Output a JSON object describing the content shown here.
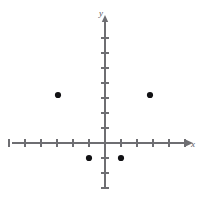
{
  "figure": {
    "background_color": "#ffffff",
    "axis_color": "#6e6e72",
    "point_color": "#111114"
  },
  "axes": {
    "x_label": "x",
    "y_label": "y",
    "origin_px": {
      "x": 105,
      "y": 143
    },
    "unit_px": {
      "x": 16,
      "y": 15
    },
    "x_line_px": {
      "x1": 12,
      "x2": 186,
      "y": 143
    },
    "y_line_px": {
      "y1": 22,
      "y2": 188,
      "x": 105
    },
    "x_ticks": [
      -6,
      -5,
      -4,
      -3,
      -2,
      -1,
      1,
      2,
      3,
      4,
      5
    ],
    "y_ticks": [
      -3,
      -2,
      -1,
      1,
      2,
      3,
      4,
      5,
      6,
      7
    ],
    "tick_half_length_px": 4,
    "arrow_x_px": {
      "x": 186,
      "y": 143
    },
    "arrow_y_px": {
      "x": 105,
      "y": 22
    },
    "x_label_px": {
      "x": 193,
      "y": 147
    },
    "y_label_px": {
      "x": 101,
      "y": 16
    }
  },
  "chart_data": {
    "type": "scatter",
    "title": "",
    "xlabel": "x",
    "ylabel": "y",
    "grid": false,
    "legend": "none",
    "xlim": [
      -6.5,
      5.5
    ],
    "ylim": [
      -3.5,
      7.5
    ],
    "xticks": [
      -6,
      -5,
      -4,
      -3,
      -2,
      -1,
      1,
      2,
      3,
      4,
      5
    ],
    "yticks": [
      -3,
      -2,
      -1,
      1,
      2,
      3,
      4,
      5,
      6,
      7
    ],
    "series": [
      {
        "name": "plotted points",
        "marker": "filled-circle",
        "color": "#111114",
        "points": [
          {
            "x": -3,
            "y": 3,
            "px": 58,
            "py": 95
          },
          {
            "x": -1,
            "y": -1,
            "px": 89,
            "py": 158
          },
          {
            "x": 1,
            "y": -1,
            "px": 121,
            "py": 158
          },
          {
            "x": 3,
            "y": 3,
            "px": 150,
            "py": 95
          }
        ]
      }
    ]
  }
}
